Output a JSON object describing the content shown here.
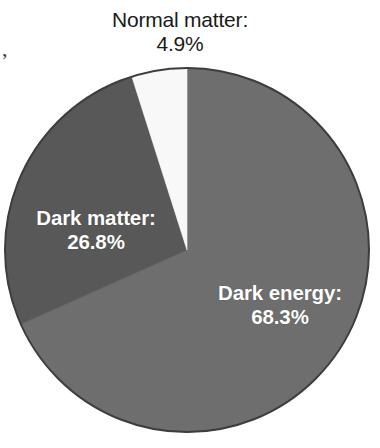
{
  "chart_data": {
    "type": "pie",
    "title": "",
    "subtitle": "",
    "xlabel": "",
    "ylabel": "",
    "legend_position": "none",
    "grid": false,
    "units": "percent",
    "total": 100.0,
    "start_angle_deg": 0,
    "direction": "clockwise",
    "categories": [
      "Dark energy",
      "Dark matter",
      "Normal matter"
    ],
    "values": [
      68.3,
      26.8,
      4.9
    ],
    "slices": [
      {
        "name": "Dark energy",
        "label_name": "Dark energy:",
        "label_value": "68.3%",
        "value": 68.3,
        "color": "#6e6e6e",
        "label_color": "#ffffff",
        "label_placement": "inside",
        "start_angle_deg": 0,
        "end_angle_deg": 245.88
      },
      {
        "name": "Dark matter",
        "label_name": "Dark matter:",
        "label_value": "26.8%",
        "value": 26.8,
        "color": "#585858",
        "label_color": "#ffffff",
        "label_placement": "inside",
        "start_angle_deg": 245.88,
        "end_angle_deg": 342.36
      },
      {
        "name": "Normal matter",
        "label_name": "Normal matter:",
        "label_value": "4.9%",
        "value": 4.9,
        "color": "#f8f8f8",
        "label_color": "#1a1a1a",
        "label_placement": "outside-top",
        "start_angle_deg": 342.36,
        "end_angle_deg": 360
      }
    ]
  },
  "figure": {
    "background": "#ffffff",
    "outline_color": "#3d3d3d",
    "center_x": 187,
    "center_y": 250,
    "radius": 182,
    "scan_artifact": ","
  }
}
